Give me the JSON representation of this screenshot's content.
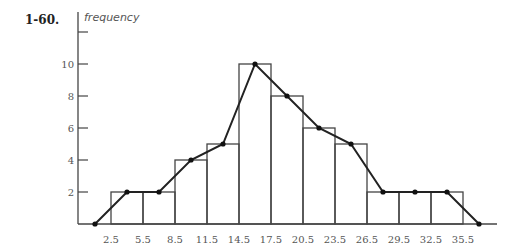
{
  "problem_number": "1-60.",
  "chart_data": {
    "type": "bar",
    "subtype": "histogram_with_frequency_polygon",
    "title": "",
    "xlabel": "",
    "ylabel": "frequency",
    "class_boundaries": [
      2.5,
      5.5,
      8.5,
      11.5,
      14.5,
      17.5,
      20.5,
      23.5,
      26.5,
      29.5,
      32.5,
      35.5
    ],
    "categories": [
      "2.5-5.5",
      "5.5-8.5",
      "8.5-11.5",
      "11.5-14.5",
      "14.5-17.5",
      "17.5-20.5",
      "20.5-23.5",
      "23.5-26.5",
      "26.5-29.5",
      "29.5-32.5",
      "32.5-35.5"
    ],
    "values": [
      2,
      2,
      4,
      5,
      10,
      8,
      6,
      5,
      2,
      2,
      2
    ],
    "frequency_polygon": {
      "x": [
        1.0,
        4.0,
        7.0,
        10.0,
        13.0,
        16.0,
        19.0,
        22.0,
        25.0,
        28.0,
        31.0,
        34.0,
        37.0
      ],
      "y": [
        0,
        2,
        2,
        4,
        5,
        10,
        8,
        6,
        5,
        2,
        2,
        2,
        0
      ]
    },
    "x_tick_labels": [
      "2.5",
      "5.5",
      "8.5",
      "11.5",
      "14.5",
      "17.5",
      "20.5",
      "23.5",
      "26.5",
      "29.5",
      "32.5",
      "35.5"
    ],
    "y_tick_labels": [
      "2",
      "4",
      "6",
      "8",
      "10"
    ],
    "y_ticks": [
      2,
      4,
      6,
      8,
      10,
      12
    ],
    "ylim": [
      0,
      12
    ],
    "xlim": [
      0,
      38
    ],
    "grid": false,
    "legend": null
  }
}
